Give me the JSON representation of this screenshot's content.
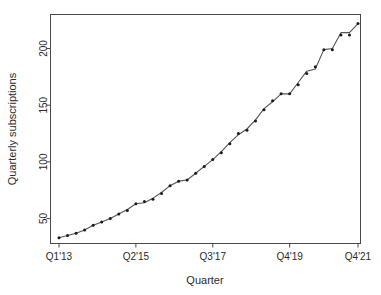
{
  "chart_data": {
    "type": "line",
    "title": "",
    "xlabel": "Quarter",
    "ylabel": "Quarterly subscriptions",
    "grid": false,
    "legend": "none",
    "xlim": [
      0,
      35
    ],
    "ylim": [
      28,
      230
    ],
    "ytick_values": [
      50,
      100,
      150,
      200
    ],
    "ytick_labels": [
      "50",
      "100",
      "150",
      "200"
    ],
    "xtick_indices": [
      0,
      9,
      18,
      27,
      35
    ],
    "xtick_labels": [
      "Q1'13",
      "Q2'15",
      "Q3'17",
      "Q4'19",
      "Q4'21"
    ],
    "categories": [
      "Q1'13",
      "Q2'13",
      "Q3'13",
      "Q4'13",
      "Q1'14",
      "Q2'14",
      "Q3'14",
      "Q4'14",
      "Q1'15",
      "Q2'15",
      "Q3'15",
      "Q4'15",
      "Q1'16",
      "Q2'16",
      "Q3'16",
      "Q4'16",
      "Q1'17",
      "Q2'17",
      "Q3'17",
      "Q4'17",
      "Q1'18",
      "Q2'18",
      "Q3'18",
      "Q4'18",
      "Q1'19",
      "Q2'19",
      "Q3'19",
      "Q4'19",
      "Q1'20",
      "Q2'20",
      "Q3'20",
      "Q4'20",
      "Q1'21",
      "Q2'21",
      "Q3'21",
      "Q4'21"
    ],
    "series": [
      {
        "name": "observed",
        "marker": "point",
        "values": [
          33,
          35,
          37,
          40,
          44,
          47,
          50,
          54,
          57,
          63,
          65,
          67,
          72,
          79,
          83,
          84,
          90,
          96,
          102,
          108,
          116,
          125,
          128,
          136,
          146,
          154,
          160,
          160,
          168,
          178,
          184,
          199,
          199,
          212,
          212,
          222
        ]
      },
      {
        "name": "fitted",
        "marker": "none",
        "values": [
          33,
          35,
          37,
          40,
          44,
          47,
          50,
          54,
          58,
          63,
          64,
          68,
          73,
          79,
          83,
          84,
          90,
          96,
          102,
          109,
          117,
          124,
          129,
          137,
          147,
          153,
          160,
          160,
          170,
          180,
          182,
          199,
          200,
          214,
          214,
          222
        ]
      }
    ]
  },
  "axes": {
    "y_title": "Quarterly subscriptions",
    "x_title": "Quarter"
  }
}
